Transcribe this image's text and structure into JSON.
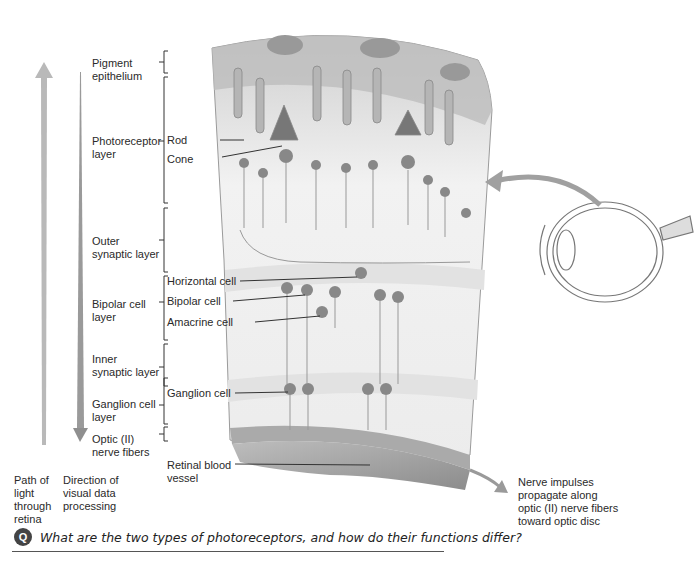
{
  "figure": {
    "layers": [
      {
        "id": "pigment",
        "label": "Pigment\nepithelium"
      },
      {
        "id": "photoreceptor",
        "label": "Photoreceptor\nlayer"
      },
      {
        "id": "outer_synaptic",
        "label": "Outer\nsynaptic layer"
      },
      {
        "id": "bipolar",
        "label": "Bipolar cell\nlayer"
      },
      {
        "id": "inner_synaptic",
        "label": "Inner\nsynaptic layer"
      },
      {
        "id": "ganglion",
        "label": "Ganglion cell\nlayer"
      },
      {
        "id": "optic",
        "label": "Optic (II)\nnerve fibers"
      }
    ],
    "cells": {
      "rod": "Rod",
      "cone": "Cone",
      "horizontal": "Horizontal cell",
      "bipolar": "Bipolar cell",
      "amacrine": "Amacrine cell",
      "ganglion": "Ganglion cell",
      "vessel": "Retinal blood\nvessel"
    },
    "arrows": {
      "light_path": "Path of\nlight\nthrough\nretina",
      "processing": "Direction of\nvisual data\nprocessing",
      "nerve_impulses": "Nerve impulses\npropagate along\noptic (II) nerve fibers\ntoward optic disc"
    },
    "colors": {
      "arrow": "#a8a8a8",
      "tissue": "#d9d9d9",
      "cell": "#8a8a8a",
      "text": "#2a2a2a"
    }
  },
  "question": {
    "icon": "Q",
    "text": "What are the two types of photoreceptors, and how do their functions differ?"
  }
}
